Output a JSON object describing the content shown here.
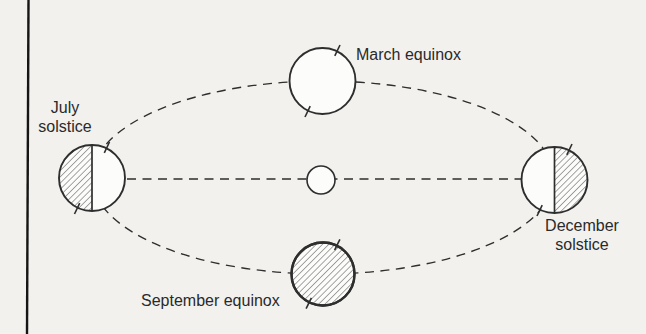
{
  "diagram": {
    "labels": {
      "march_equinox": "March equinox",
      "july_solstice": {
        "line1": "July",
        "line2": "solstice"
      },
      "september_equinox": "September equinox",
      "december_solstice": {
        "line1": "December",
        "line2": "solstice"
      }
    },
    "shading": {
      "march_equinox": "none",
      "july_solstice": "left-half-hatched",
      "september_equinox": "fully-hatched",
      "december_solstice": "right-half-hatched"
    },
    "colors": {
      "background": "#f2f1ee",
      "line": "#2e2e2e",
      "text": "#2a2a2a",
      "circle_fill": "#fcfcfa",
      "page_edge": "#151515"
    }
  }
}
